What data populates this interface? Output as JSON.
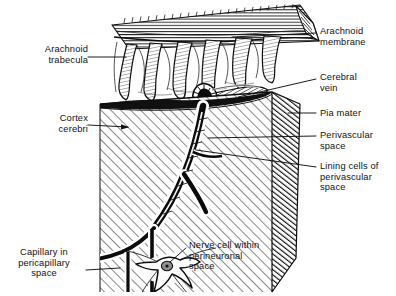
{
  "figure": {
    "kind": "anatomical-line-engraving",
    "background_color": "#ffffff",
    "ink_color": "#101010"
  },
  "labels": {
    "arachnoid_trabecula": "Arachnoid\ntrabecula",
    "cortex_cerebri": "Cortex\ncerebri",
    "capillary_in_pericapillary_space": "Capillary in\npericapillary\nspace",
    "nerve_cell_within_perineuronal_space": "Nerve cell within\nperineuronal\nspace",
    "arachnoid_membrane": "Arachnoid\nmembrane",
    "cerebral_vein": "Cerebral\nvein",
    "pia_mater": "Pia mater",
    "perivascular_space": "Perivascular\nspace",
    "lining_cells_of_perivascular_space": "Lining cells of\nperivascular\nspace"
  }
}
